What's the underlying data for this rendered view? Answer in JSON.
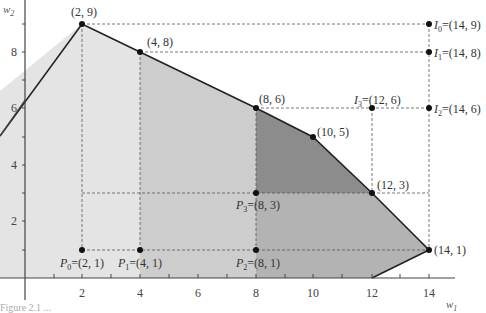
{
  "diagram": {
    "axes": {
      "x_label": "w",
      "x_label_sub": "1",
      "y_label": "w",
      "y_label_sub": "2",
      "x_ticks": [
        "2",
        "4",
        "6",
        "8",
        "10",
        "12",
        "14"
      ],
      "y_ticks": [
        "2",
        "4",
        "6",
        "8"
      ]
    },
    "polygon_vertices": [
      [
        0,
        7
      ],
      [
        2,
        9
      ],
      [
        4,
        8
      ],
      [
        8,
        6
      ],
      [
        10,
        5
      ],
      [
        12,
        3
      ],
      [
        14,
        1
      ],
      [
        12,
        0
      ]
    ],
    "vertex_labels": [
      {
        "text": "(2, 9)",
        "point": [
          2,
          9
        ]
      },
      {
        "text": "(4, 8)",
        "point": [
          4,
          8
        ]
      },
      {
        "text": "(8, 6)",
        "point": [
          8,
          6
        ]
      },
      {
        "text": "(10, 5)",
        "point": [
          10,
          5
        ]
      },
      {
        "text": "(12, 3)",
        "point": [
          12,
          3
        ]
      },
      {
        "text": "(14, 1)",
        "point": [
          14,
          1
        ]
      }
    ],
    "ideal_points": [
      {
        "name": "I",
        "sub": "0",
        "coord": "=(14, 9)",
        "point": [
          14,
          9
        ]
      },
      {
        "name": "I",
        "sub": "1",
        "coord": "=(14, 8)",
        "point": [
          14,
          8
        ]
      },
      {
        "name": "I",
        "sub": "2",
        "coord": "=(14, 6)",
        "point": [
          14,
          6
        ]
      },
      {
        "name": "I",
        "sub": "3",
        "coord": "=(12, 6)",
        "point": [
          12,
          6
        ]
      }
    ],
    "nadir_points": [
      {
        "name": "P",
        "sub": "0",
        "coord": "=(2, 1)",
        "point": [
          2,
          1
        ]
      },
      {
        "name": "P",
        "sub": "1",
        "coord": "=(4, 1)",
        "point": [
          4,
          1
        ]
      },
      {
        "name": "P",
        "sub": "2",
        "coord": "=(8, 1)",
        "point": [
          8,
          1
        ]
      },
      {
        "name": "P",
        "sub": "3",
        "coord": "=(8, 3)",
        "point": [
          8,
          3
        ]
      }
    ],
    "region_colors": {
      "lightest": "#e6e6e6",
      "light": "#cfcfcf",
      "medium": "#b4b4b4",
      "dark": "#8a8a8a"
    },
    "caption": "Figure 2.1 ..."
  }
}
